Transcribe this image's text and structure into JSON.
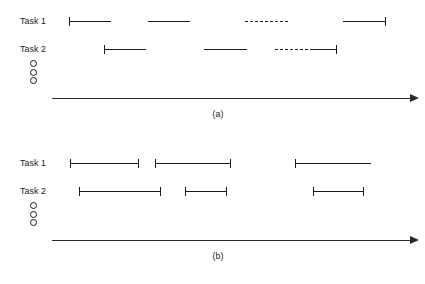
{
  "figure": {
    "line_color": "#1a1a1a",
    "axis_color": "#2b2b2b",
    "background": "#ffffff"
  },
  "panels": [
    {
      "id": "a",
      "caption": "(a)",
      "caption_x": 218,
      "caption_y": 108,
      "axis": {
        "x": 52,
        "y": 98,
        "width": 358
      },
      "ellipsis": {
        "x": 30,
        "y": 60,
        "count": 3
      },
      "rows": [
        {
          "label": "Task 1",
          "label_x": 20,
          "label_y": 15,
          "y": 21,
          "segments": [
            {
              "x": 69,
              "width": 42,
              "style": "solid",
              "tick_left": true,
              "tick_right": false
            },
            {
              "x": 148,
              "width": 42,
              "style": "solid",
              "tick_left": false,
              "tick_right": false
            },
            {
              "x": 245,
              "width": 43,
              "style": "dashed",
              "tick_left": false,
              "tick_right": false
            },
            {
              "x": 343,
              "width": 42,
              "style": "solid",
              "tick_left": false,
              "tick_right": true
            }
          ]
        },
        {
          "label": "Task 2",
          "label_x": 20,
          "label_y": 43,
          "y": 49,
          "segments": [
            {
              "x": 104,
              "width": 42,
              "style": "solid",
              "tick_left": true,
              "tick_right": false
            },
            {
              "x": 204,
              "width": 43,
              "style": "solid",
              "tick_left": false,
              "tick_right": false
            },
            {
              "x": 275,
              "width": 38,
              "style": "dashed",
              "tick_left": false,
              "tick_right": false
            },
            {
              "x": 313,
              "width": 23,
              "style": "solid",
              "tick_left": false,
              "tick_right": true
            }
          ]
        }
      ]
    },
    {
      "id": "b",
      "caption": "(b)",
      "caption_x": 218,
      "caption_y": 108,
      "axis": {
        "x": 52,
        "y": 98,
        "width": 358
      },
      "ellipsis": {
        "x": 30,
        "y": 60,
        "count": 3
      },
      "rows": [
        {
          "label": "Task 1",
          "label_x": 20,
          "label_y": 15,
          "y": 21,
          "segments": [
            {
              "x": 70,
              "width": 68,
              "style": "solid",
              "tick_left": true,
              "tick_right": true
            },
            {
              "x": 155,
              "width": 75,
              "style": "solid",
              "tick_left": true,
              "tick_right": true
            },
            {
              "x": 295,
              "width": 76,
              "style": "solid",
              "tick_left": true,
              "tick_right": false
            }
          ]
        },
        {
          "label": "Task 2",
          "label_x": 20,
          "label_y": 43,
          "y": 49,
          "segments": [
            {
              "x": 79,
              "width": 81,
              "style": "solid",
              "tick_left": true,
              "tick_right": true
            },
            {
              "x": 185,
              "width": 41,
              "style": "solid",
              "tick_left": true,
              "tick_right": true
            },
            {
              "x": 313,
              "width": 50,
              "style": "solid",
              "tick_left": true,
              "tick_right": true
            }
          ]
        }
      ]
    }
  ]
}
